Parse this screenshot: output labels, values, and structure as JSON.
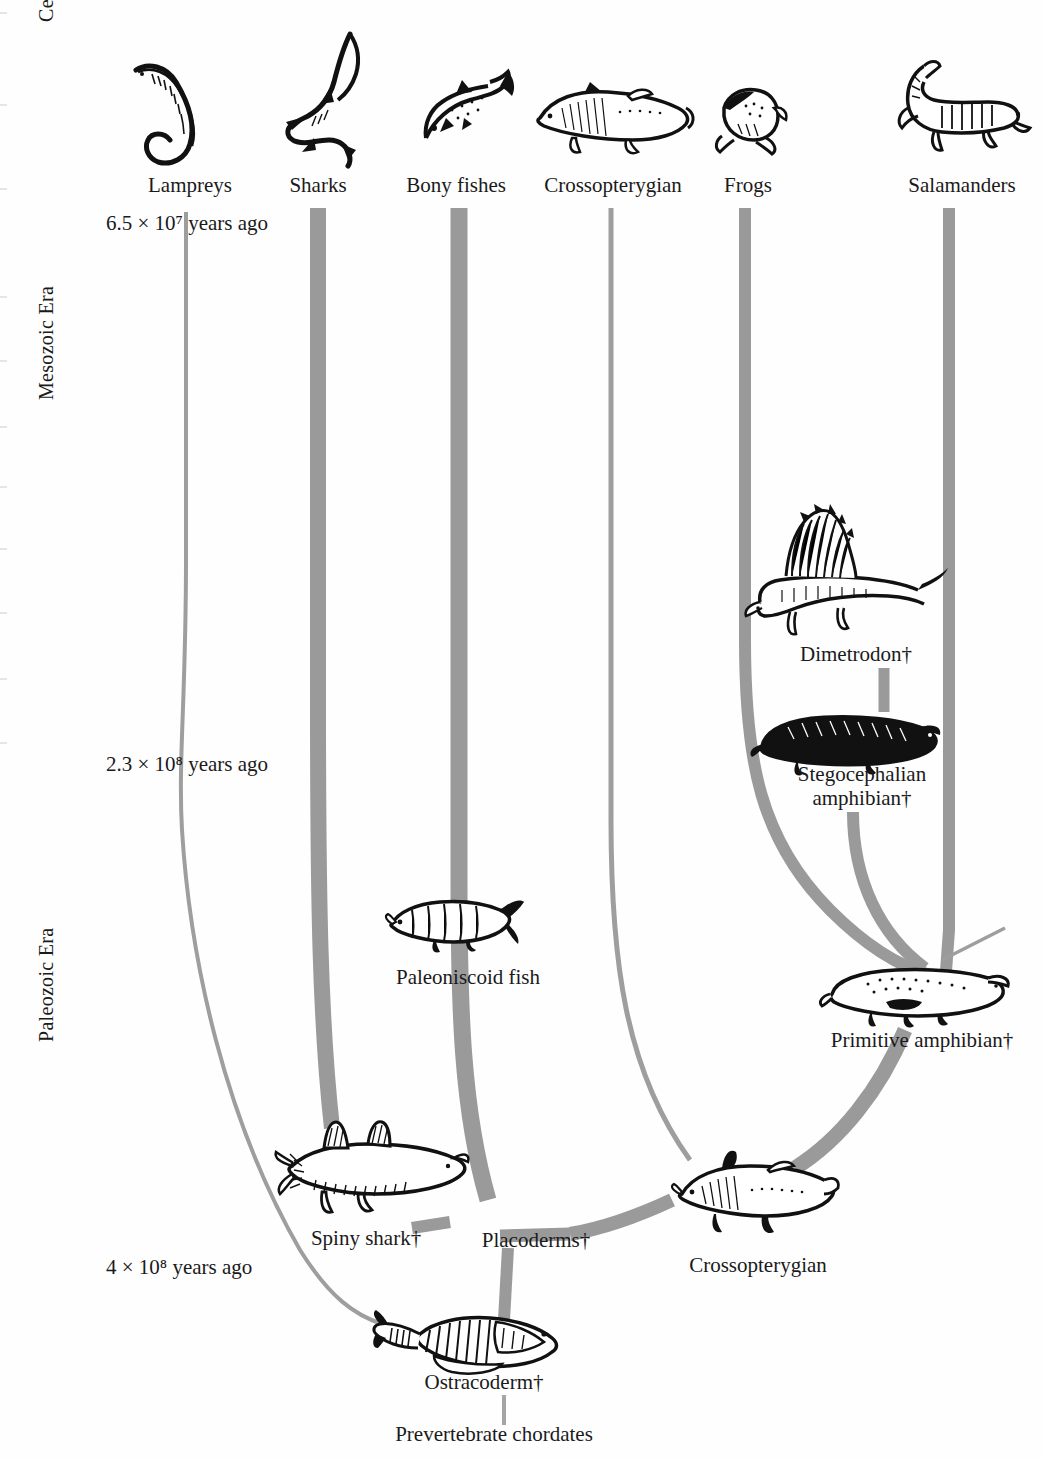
{
  "figure": {
    "branch_color": "#9a9a9a",
    "text_color": "#1a1a1a",
    "background": "#fefefe"
  },
  "eras": [
    {
      "name": "Cenozoic Era",
      "id": "cenozoic"
    },
    {
      "name": "Mesozoic Era",
      "id": "mesozoic"
    },
    {
      "name": "Paleozoic Era",
      "id": "paleozoic"
    }
  ],
  "time_markers": [
    {
      "id": "t1",
      "text": "6.5 × 10⁷  years ago",
      "value": "6.5e7"
    },
    {
      "id": "t2",
      "text": "2.3 × 10⁸ years ago",
      "value": "2.3e8"
    },
    {
      "id": "t3",
      "text": "4 × 10⁸ years ago",
      "value": "4e8"
    }
  ],
  "extant_taxa": [
    {
      "id": "lampreys",
      "label": "Lampreys",
      "icon": "lamprey-icon",
      "branch_width": "thin"
    },
    {
      "id": "sharks",
      "label": "Sharks",
      "icon": "shark-icon",
      "branch_width": "thick"
    },
    {
      "id": "bony-fishes",
      "label": "Bony fishes",
      "icon": "bony-fish-icon",
      "branch_width": "thick"
    },
    {
      "id": "crossopterygian-top",
      "label": "Crossopterygian",
      "icon": "coelacanth-icon",
      "branch_width": "thin"
    },
    {
      "id": "frogs",
      "label": "Frogs",
      "icon": "frog-icon",
      "branch_width": "medium"
    },
    {
      "id": "salamanders",
      "label": "Salamanders",
      "icon": "salamander-icon",
      "branch_width": "medium"
    }
  ],
  "fossil_nodes": [
    {
      "id": "dimetrodon",
      "label": "Dimetrodon†",
      "icon": "dimetrodon-icon",
      "extinct": true
    },
    {
      "id": "stegocephalian",
      "label_line1": "Stegocephalian",
      "label_line2": "amphibian†",
      "icon": "stegocephalian-icon",
      "extinct": true
    },
    {
      "id": "primitive-amphibian",
      "label": "Primitive amphibian†",
      "icon": "primitive-amphibian-icon",
      "extinct": true
    },
    {
      "id": "paleoniscoid",
      "label": "Paleoniscoid fish",
      "icon": "paleoniscoid-icon",
      "extinct": false
    },
    {
      "id": "spiny-shark",
      "label": "Spiny shark†",
      "icon": "spiny-shark-icon",
      "extinct": true
    },
    {
      "id": "placoderms",
      "label": "Placoderms†",
      "icon": "none",
      "extinct": true
    },
    {
      "id": "crossopterygian-fossil",
      "label": "Crossopterygian",
      "icon": "crossopterygian-fossil-icon",
      "extinct": false
    },
    {
      "id": "ostracoderm",
      "label": "Ostracoderm†",
      "icon": "ostracoderm-icon",
      "extinct": true
    },
    {
      "id": "prevertebrate",
      "label": "Prevertebrate chordates",
      "icon": "none",
      "extinct": false
    }
  ]
}
